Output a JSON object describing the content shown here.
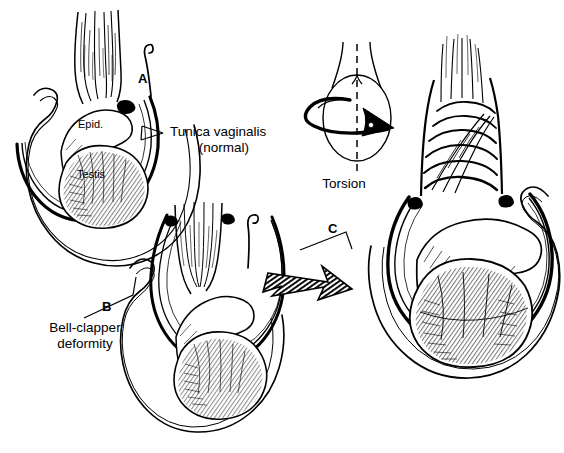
{
  "figure": {
    "background_color": "#ffffff",
    "ink_color": "#000000",
    "width": 564,
    "height": 453,
    "style": "black-and-white pen-and-ink line drawing"
  },
  "panels": [
    {
      "letter": "A",
      "name": "normal-anatomy",
      "description": "Normal testis suspended within tunica vaginalis"
    },
    {
      "letter": "B",
      "name": "bell-clapper-deformity",
      "description": "Bell-clapper deformity with high tunica vaginalis insertion"
    },
    {
      "letter": "C",
      "name": "torsed-testis",
      "description": "Torsion of spermatic cord with twisted cord and swollen testis"
    }
  ],
  "annotations": {
    "panel_a_letter": "A",
    "panel_b_letter": "B",
    "panel_c_letter": "C",
    "epididymis": "Epid.",
    "testis": "Testis",
    "tunica_line1": "Tunica vaginalis",
    "tunica_line2": "(normal)",
    "bell_clapper_line1": "Bell-clapper",
    "bell_clapper_line2": "deformity",
    "torsion": "Torsion"
  },
  "icons": {
    "rotation_arrow": "curved-rotation-arrow",
    "transition_arrow": "hatched-block-arrow",
    "leader_line": "forked-leader-line",
    "axis": "vertical-dashed-axis"
  }
}
